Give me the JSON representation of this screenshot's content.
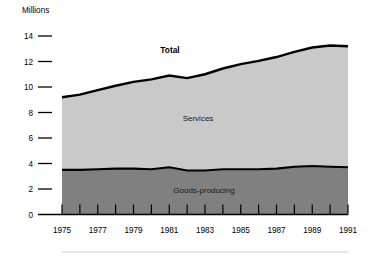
{
  "chart_data": {
    "type": "area",
    "title": "",
    "subtitle": "",
    "ylabel": "Millions",
    "xlabel": "",
    "ylim": [
      0,
      14
    ],
    "xlim": [
      1975,
      1991
    ],
    "grid": false,
    "legend_position": "inline-annotations",
    "stacked": true,
    "y_ticks": [
      "14",
      "12",
      "10",
      "8",
      "6",
      "4",
      "2",
      "0"
    ],
    "y_tick_values": [
      14,
      12,
      10,
      8,
      6,
      4,
      2,
      0
    ],
    "x_ticks": [
      "1975",
      "1977",
      "1979",
      "1981",
      "1983",
      "1985",
      "1987",
      "1989",
      "1991"
    ],
    "x_tick_values": [
      1975,
      1977,
      1979,
      1981,
      1983,
      1985,
      1987,
      1989,
      1991
    ],
    "x_minor_tick_values": [
      1976,
      1978,
      1980,
      1982,
      1984,
      1986,
      1988,
      1990
    ],
    "x": [
      1975,
      1976,
      1977,
      1978,
      1979,
      1980,
      1981,
      1982,
      1983,
      1984,
      1985,
      1986,
      1987,
      1988,
      1989,
      1990,
      1991
    ],
    "series": [
      {
        "name": "Goods-producing",
        "color": "#808080",
        "values": [
          3.5,
          3.5,
          3.55,
          3.6,
          3.6,
          3.55,
          3.7,
          3.45,
          3.45,
          3.55,
          3.55,
          3.55,
          3.6,
          3.75,
          3.8,
          3.75,
          3.7
        ]
      },
      {
        "name": "Services",
        "color": "#c9c9c9",
        "values": [
          5.7,
          5.9,
          6.2,
          6.5,
          6.8,
          7.05,
          7.2,
          7.25,
          7.55,
          7.9,
          8.25,
          8.5,
          8.75,
          9.0,
          9.3,
          9.5,
          9.5
        ]
      }
    ],
    "total": {
      "name": "Total",
      "color": "#000000",
      "values": [
        9.2,
        9.4,
        9.75,
        10.1,
        10.4,
        10.6,
        10.9,
        10.7,
        11.0,
        11.45,
        11.8,
        12.05,
        12.35,
        12.75,
        13.1,
        13.25,
        13.2
      ]
    },
    "annotations": [
      {
        "text": "Total",
        "series": "total"
      },
      {
        "text": "Services",
        "series": "services"
      },
      {
        "text": "Goods-producing",
        "series": "goods"
      }
    ]
  },
  "labels": {
    "unit": "Millions",
    "total": "Total",
    "services": "Services",
    "goods": "Goods-producing"
  },
  "colors": {
    "services_fill": "#c9c9c9",
    "goods_fill": "#808080",
    "line": "#000000",
    "axis": "#000000",
    "footer_rule": "#cccccc"
  }
}
